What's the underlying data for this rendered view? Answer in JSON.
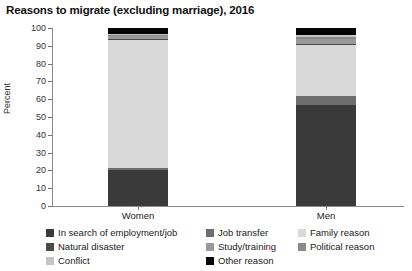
{
  "chart_data": {
    "type": "bar",
    "title": "Reasons to migrate (excluding marriage), 2016",
    "xlabel": "",
    "ylabel": "Percent",
    "ylim": [
      0,
      100
    ],
    "yticks": [
      "0",
      "10",
      "20",
      "30",
      "40",
      "50",
      "60",
      "70",
      "80",
      "90",
      "100"
    ],
    "grid": false,
    "stacked": true,
    "legend_position": "bottom",
    "categories": [
      "Women",
      "Men"
    ],
    "series": [
      {
        "name": "In search of employment/job",
        "color": "#3a3a3a",
        "values": [
          20.5,
          57.0
        ]
      },
      {
        "name": "Job transfer",
        "color": "#6e6e6e",
        "values": [
          1.0,
          5.0
        ]
      },
      {
        "name": "Family reason",
        "color": "#d9d9d9",
        "values": [
          72.0,
          28.5
        ]
      },
      {
        "name": "Natural disaster",
        "color": "#4a4a4a",
        "values": [
          0.4,
          0.4
        ]
      },
      {
        "name": "Study/training",
        "color": "#9a9a9a",
        "values": [
          1.6,
          3.2
        ]
      },
      {
        "name": "Political reason",
        "color": "#8a8a8a",
        "values": [
          0.5,
          0.8
        ]
      },
      {
        "name": "Conflict",
        "color": "#c4c4c4",
        "values": [
          0.8,
          1.0
        ]
      },
      {
        "name": "Other reason",
        "color": "#050505",
        "values": [
          3.2,
          4.1
        ]
      }
    ]
  },
  "legend": {
    "items": [
      {
        "label": "In search of employment/job",
        "color": "#3a3a3a"
      },
      {
        "label": "Job transfer",
        "color": "#6e6e6e"
      },
      {
        "label": "Family reason",
        "color": "#d9d9d9"
      },
      {
        "label": "Natural disaster",
        "color": "#4a4a4a"
      },
      {
        "label": "Study/training",
        "color": "#9a9a9a"
      },
      {
        "label": "Political reason",
        "color": "#8a8a8a"
      },
      {
        "label": "Conflict",
        "color": "#c4c4c4"
      },
      {
        "label": "Other reason",
        "color": "#050505"
      }
    ]
  }
}
